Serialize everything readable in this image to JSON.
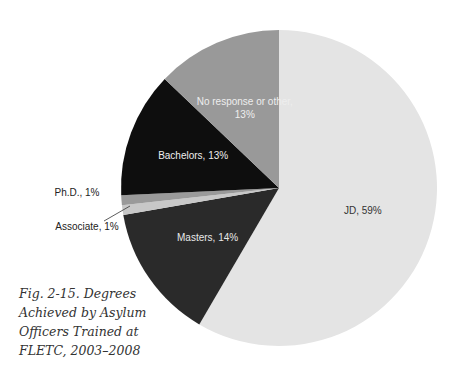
{
  "chart_data": {
    "type": "pie",
    "title": "Fig. 2-15. Degrees Achieved by Asylum Officers Trained at FLETC, 2003–2008",
    "start": "top",
    "direction": "clockwise",
    "slices": [
      {
        "name": "JD",
        "value": 59,
        "label": "JD, 59%",
        "color": "#e4e4e4",
        "text_color": "#333333"
      },
      {
        "name": "Masters",
        "value": 14,
        "label": "Masters, 14%",
        "color": "#2a2a2a",
        "text_color": "#e8e8e8"
      },
      {
        "name": "Associate",
        "value": 1,
        "label": "Associate, 1%",
        "color": "#c8c8c8",
        "text_color": "#222222"
      },
      {
        "name": "Ph.D.",
        "value": 1,
        "label": "Ph.D., 1%",
        "color": "#9a9a9a",
        "text_color": "#222222"
      },
      {
        "name": "Bachelors",
        "value": 13,
        "label": "Bachelors, 13%",
        "color": "#0e0e0e",
        "text_color": "#eeeeee"
      },
      {
        "name": "No response or other",
        "value": 13,
        "label": "No response or other, 13%",
        "label_lines": [
          "No response or other,",
          "13%"
        ],
        "color": "#999999",
        "text_color": "#eeeeee"
      }
    ]
  },
  "caption": {
    "lines": [
      "Fig. 2-15. Degrees",
      "Achieved by Asylum",
      "Officers Trained at",
      "FLETC, 2003–2008"
    ]
  }
}
